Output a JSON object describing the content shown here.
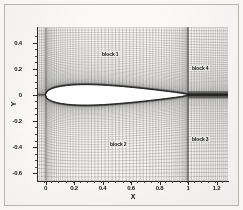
{
  "figure": {
    "kind": "cfd-multiblock-mesh",
    "background_color": "#fbfaf8",
    "mesh_color": "#3a3a3a",
    "axis_color": "#2b2b2b"
  },
  "axes": {
    "x_title": "X",
    "y_title": "Y",
    "x_ticks": [
      "0",
      "0.2",
      "0.4",
      "0.6",
      "0.8",
      "1",
      "1.2"
    ],
    "x_tick_values": [
      0,
      0.2,
      0.4,
      0.6,
      0.8,
      1.0,
      1.2
    ],
    "y_ticks": [
      "0.4",
      "0.2",
      "0",
      "-0.2",
      "-0.4",
      "-0.6"
    ],
    "y_tick_values": [
      0.4,
      0.2,
      0,
      -0.2,
      -0.4,
      -0.6
    ]
  },
  "annotations": {
    "block_1": "block 1",
    "block_2": "block 2",
    "block_3": "block 3",
    "block_4": "block 4"
  },
  "chart_data": {
    "type": "line",
    "title": "",
    "xlabel": "X",
    "ylabel": "Y",
    "xlim": [
      -0.06,
      1.28
    ],
    "ylim": [
      -0.66,
      0.52
    ],
    "grid": false,
    "legend": null,
    "xticks": [
      0,
      0.2,
      0.4,
      0.6,
      0.8,
      1.0,
      1.2
    ],
    "yticks": [
      0.4,
      0.2,
      0,
      -0.2,
      -0.4,
      -0.6
    ],
    "annotations": [
      {
        "text": "block 1",
        "x": 0.45,
        "y": 0.33
      },
      {
        "text": "block 2",
        "x": 0.5,
        "y": -0.3
      },
      {
        "text": "block 3",
        "x": 1.08,
        "y": -0.27
      },
      {
        "text": "block 4",
        "x": 1.08,
        "y": 0.25
      }
    ],
    "series": [
      {
        "name": "airfoil-upper-surface",
        "x": [
          0.0,
          0.005,
          0.0125,
          0.025,
          0.05,
          0.075,
          0.1,
          0.15,
          0.2,
          0.25,
          0.3,
          0.35,
          0.4,
          0.45,
          0.5,
          0.55,
          0.6,
          0.65,
          0.7,
          0.75,
          0.8,
          0.85,
          0.9,
          0.95,
          1.0
        ],
        "y": [
          0.0,
          0.0178,
          0.0271,
          0.0371,
          0.0496,
          0.0577,
          0.0636,
          0.0717,
          0.0761,
          0.078,
          0.0782,
          0.0769,
          0.0745,
          0.0712,
          0.0672,
          0.0626,
          0.0576,
          0.0521,
          0.0463,
          0.0402,
          0.0338,
          0.0271,
          0.0202,
          0.0126,
          0.0021
        ]
      },
      {
        "name": "airfoil-lower-surface",
        "x": [
          0.0,
          0.005,
          0.0125,
          0.025,
          0.05,
          0.075,
          0.1,
          0.15,
          0.2,
          0.25,
          0.3,
          0.35,
          0.4,
          0.45,
          0.5,
          0.55,
          0.6,
          0.65,
          0.7,
          0.75,
          0.8,
          0.85,
          0.9,
          0.95,
          1.0
        ],
        "y": [
          0.0,
          -0.0178,
          -0.0271,
          -0.0371,
          -0.0496,
          -0.0577,
          -0.0636,
          -0.0717,
          -0.0761,
          -0.078,
          -0.0782,
          -0.0769,
          -0.0745,
          -0.0712,
          -0.0672,
          -0.0626,
          -0.0576,
          -0.0521,
          -0.0463,
          -0.0402,
          -0.0338,
          -0.0271,
          -0.0202,
          -0.0126,
          -0.0021
        ]
      },
      {
        "name": "wake-centerline",
        "x": [
          1.0,
          1.28
        ],
        "y": [
          0.0,
          0.0
        ]
      }
    ],
    "mesh": {
      "description": "Structured 4-block C-grid around airfoil with wake blocks downstream of trailing edge",
      "blocks": [
        {
          "name": "block 1",
          "region": "upper-field",
          "x_range": [
            -0.06,
            1.0
          ],
          "y_range": [
            0.0,
            0.52
          ]
        },
        {
          "name": "block 2",
          "region": "lower-field",
          "x_range": [
            -0.06,
            1.0
          ],
          "y_range": [
            -0.66,
            0.0
          ]
        },
        {
          "name": "block 3",
          "region": "lower-wake",
          "x_range": [
            1.0,
            1.28
          ],
          "y_range": [
            -0.66,
            0.0
          ]
        },
        {
          "name": "block 4",
          "region": "upper-wake",
          "x_range": [
            1.0,
            1.28
          ],
          "y_range": [
            0.0,
            0.52
          ]
        }
      ],
      "streamwise_lines": 88,
      "normal_lines": 56,
      "clustering": "strong clustering toward airfoil surface and wake line"
    }
  }
}
